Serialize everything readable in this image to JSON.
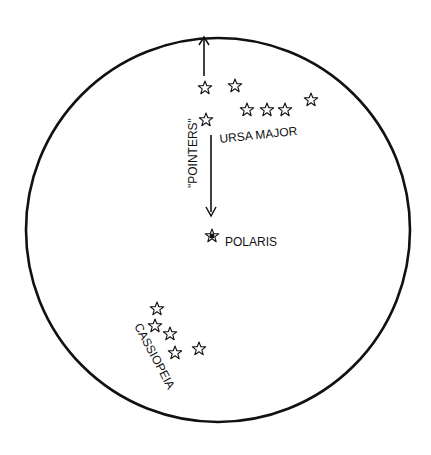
{
  "diagram": {
    "labels": {
      "ursa_major": "URSA MAJOR",
      "pointers": "\"POINTERS\"",
      "polaris": "POLARIS",
      "cassiopeia": "CASSIOPEIA"
    }
  }
}
